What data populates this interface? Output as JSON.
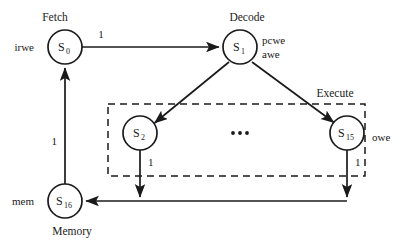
{
  "diagram": {
    "type": "state-machine",
    "background_color": "#ffffff",
    "line_color": "#1a1a1a",
    "states": [
      {
        "id": "s0",
        "label": "S",
        "subscript": "0",
        "stage_label": "Fetch",
        "stage_label_position": "above",
        "signal_label": "irwe",
        "signal_label_position": "left",
        "cx": 65,
        "cy": 47,
        "r": 17
      },
      {
        "id": "s1",
        "label": "S",
        "subscript": "1",
        "stage_label": "Decode",
        "stage_label_position": "above",
        "signal_label": "pcwe",
        "signal_label_2": "awe",
        "signal_label_position": "right",
        "cx": 240,
        "cy": 47,
        "r": 17
      },
      {
        "id": "s2",
        "label": "S",
        "subscript": "2",
        "stage_label": "",
        "signal_label": "",
        "cx": 140,
        "cy": 133,
        "r": 17
      },
      {
        "id": "s15",
        "label": "S",
        "subscript": "15",
        "stage_label": "",
        "signal_label": "",
        "cx": 347,
        "cy": 133,
        "r": 17
      },
      {
        "id": "s16",
        "label": "S",
        "subscript": "16",
        "stage_label": "Memory",
        "stage_label_position": "below",
        "signal_label": "mem",
        "signal_label_position": "left",
        "cx": 65,
        "cy": 201,
        "r": 17
      }
    ],
    "group_box": {
      "stage_label": "Execute",
      "signal_label": "owe",
      "style": "dashed",
      "x": 108,
      "y": 104,
      "width": 257,
      "height": 72
    },
    "ellipsis": {
      "text": "...",
      "cx": 240,
      "cy": 133
    },
    "transitions": [
      {
        "from": "s0",
        "to": "s1",
        "label": "1",
        "shape": "straight-horizontal"
      },
      {
        "from": "s1",
        "to": "s2",
        "label": "",
        "shape": "diagonal"
      },
      {
        "from": "s1",
        "to": "s15",
        "label": "",
        "shape": "diagonal"
      },
      {
        "from": "s2",
        "to": "s16",
        "label": "1",
        "shape": "down-then-left"
      },
      {
        "from": "s15",
        "to": "s16",
        "label": "1",
        "shape": "down-then-left"
      },
      {
        "from": "s16",
        "to": "s0",
        "label": "1",
        "shape": "straight-vertical"
      }
    ]
  }
}
